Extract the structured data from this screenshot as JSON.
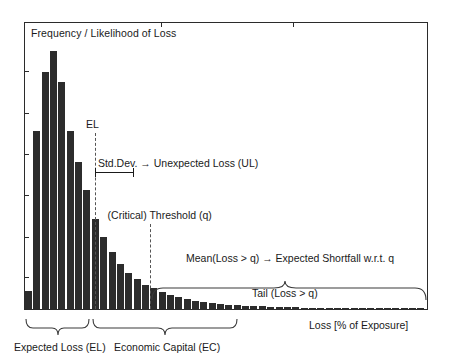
{
  "figure": {
    "y_axis_title": "Frequency / Likelihood of Loss",
    "x_axis_title": "Loss [% of Exposure]"
  },
  "markers": {
    "el": {
      "label": "EL",
      "x_frac": 0.174
    },
    "threshold": {
      "label": "(Critical) Threshold (q)",
      "x_frac": 0.31
    }
  },
  "annotations": {
    "std_dev": "Std.Dev. → Unexpected Loss (UL)",
    "expected_shortfall": "Mean(Loss > q) → Expected Shortfall w.r.t. q",
    "tail": "Tail (Loss > q)"
  },
  "braces": {
    "expected_loss": "Expected Loss (EL)",
    "economic_capital": "Economic Capital (EC)"
  },
  "colors": {
    "bar_fill": "#2c2c2c",
    "frame": "#2b2b2b",
    "dash": "#555555",
    "text": "#1a1a1a",
    "background": "#ffffff"
  },
  "chart_data": {
    "type": "bar",
    "title": "",
    "subtitle": "",
    "xlabel": "Loss [% of Exposure]",
    "ylabel": "Frequency / Likelihood of Loss",
    "grid": false,
    "legend": "none",
    "xlim": [
      0,
      48
    ],
    "ylim": [
      0,
      100
    ],
    "axis_tick_labels": {
      "x": [],
      "y": []
    },
    "note": "Loss distribution histogram: steep rise, peak near left, long right tail. Values are relative frequencies (percent of max).",
    "categories": [
      1,
      2,
      3,
      4,
      5,
      6,
      7,
      8,
      9,
      10,
      11,
      12,
      13,
      14,
      15,
      16,
      17,
      18,
      19,
      20,
      21,
      22,
      23,
      24,
      25,
      26,
      27,
      28,
      29,
      30,
      31,
      32,
      33,
      34,
      35,
      36,
      37,
      38,
      39,
      40,
      41,
      42,
      43,
      44,
      45,
      46,
      47,
      48
    ],
    "values": [
      7,
      69,
      92,
      100,
      88,
      69,
      57,
      46,
      35,
      28,
      22,
      17.5,
      14,
      11.5,
      9.5,
      8,
      6.6,
      5.5,
      4.6,
      3.9,
      3.3,
      2.8,
      2.4,
      2.0,
      1.7,
      1.5,
      1.3,
      1.15,
      1.0,
      0.9,
      0.8,
      0.72,
      0.65,
      0.58,
      0.52,
      0.47,
      0.43,
      0.4,
      0.37,
      0.34,
      0.32,
      0.3,
      0.28,
      0.26,
      0.25,
      0.24,
      0.23,
      0.22
    ]
  },
  "ticks": {
    "left_y_fracs": [
      0.17,
      0.315,
      0.46,
      0.6,
      0.745,
      0.885
    ],
    "top_x_fracs": [
      0.34,
      0.665
    ]
  }
}
